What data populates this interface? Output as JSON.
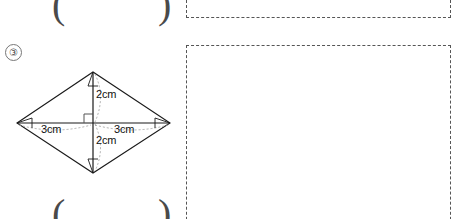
{
  "worksheet": {
    "question_number": "③",
    "top_answer_parens": {
      "open": "(",
      "close": ")"
    },
    "bottom_answer_parens": {
      "open": "(",
      "close": ")"
    }
  },
  "figure": {
    "name": "rhombus-with-diagonals",
    "labels": {
      "upper_vertical": "2cm",
      "lower_vertical": "2cm",
      "left_horizontal": "3cm",
      "right_horizontal": "3cm"
    },
    "right_angle_mark": "right-angle-square",
    "stroke_color": "#1a1a1a",
    "guide_color": "#8a8a8a"
  },
  "answer_boxes": [
    {
      "id": "answer-box-1"
    },
    {
      "id": "answer-box-2"
    }
  ]
}
